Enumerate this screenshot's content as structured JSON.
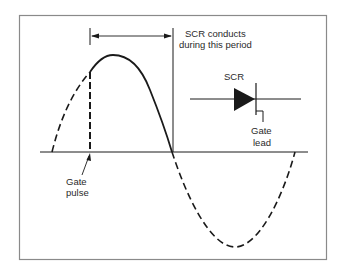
{
  "diagram": {
    "labels": {
      "period_line1": "SCR conducts",
      "period_line2": "during this period",
      "scr": "SCR",
      "gate_lead_line1": "Gate",
      "gate_lead_line2": "lead",
      "gate_pulse_line1": "Gate",
      "gate_pulse_line2": "pulse"
    },
    "colors": {
      "stroke": "#1a1a1a",
      "frame": "#8a8a8a",
      "background": "#ffffff"
    },
    "elements": [
      "frame-border",
      "horizontal-axis",
      "sine-wave-dashed-rising",
      "sine-wave-solid-conducting",
      "sine-wave-dashed-negative",
      "gate-pulse-marker",
      "conduction-period-arrow",
      "scr-symbol"
    ]
  }
}
